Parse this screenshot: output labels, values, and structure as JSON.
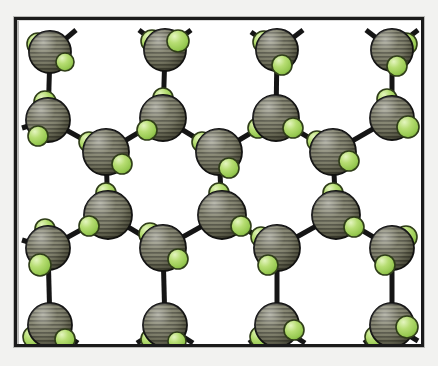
{
  "figure": {
    "kind": "molecular-lattice-diagram",
    "title": "",
    "caption": "",
    "frame": {
      "border_color": "#1b1b1b",
      "border_width": 3,
      "background": "#ffffff",
      "paper_color": "#f2f2f0",
      "x": 14,
      "y": 17,
      "width": 410,
      "height": 330
    },
    "legend": [],
    "annotations": []
  },
  "chart_data": {
    "type": "scatter",
    "title": "",
    "xlabel": "",
    "ylabel": "",
    "grid": false,
    "legend_position": "none",
    "xlim": [
      0,
      438
    ],
    "ylim": [
      0,
      366
    ],
    "species": [
      {
        "name": "large-hatched-sphere",
        "role": "central atom",
        "color": "#74745f",
        "highlight": "#9a9a86",
        "shadow": "#4c4c3e",
        "outline": "#141414",
        "hatch": "horizontal-lines",
        "radius": 20
      },
      {
        "name": "small-green-sphere",
        "role": "ligand atom",
        "color": "#a9d466",
        "highlight": "#c9e792",
        "shadow": "#7fa93f",
        "outline": "#2c3a16",
        "hatch": "none",
        "radius": 10
      }
    ],
    "bond": {
      "color": "#151515",
      "width": 5
    },
    "atoms": [
      {
        "id": "a1",
        "x": 50,
        "y": 52,
        "r": 21,
        "ligands": [
          {
            "dx": -12,
            "dy": -8,
            "r": 11
          },
          {
            "dx": 15,
            "dy": 10,
            "r": 9
          }
        ],
        "stubs": [
          {
            "dx": 26,
            "dy": -22
          },
          {
            "dx": -22,
            "dy": -12
          }
        ]
      },
      {
        "id": "a2",
        "x": 165,
        "y": 50,
        "r": 21,
        "ligands": [
          {
            "dx": -13,
            "dy": -9,
            "r": 11
          },
          {
            "dx": 13,
            "dy": -9,
            "r": 11
          }
        ],
        "stubs": [
          {
            "dx": 26,
            "dy": -20
          },
          {
            "dx": -26,
            "dy": -20
          }
        ]
      },
      {
        "id": "a3",
        "x": 277,
        "y": 50,
        "r": 21,
        "ligands": [
          {
            "dx": -13,
            "dy": -8,
            "r": 11
          },
          {
            "dx": 5,
            "dy": 15,
            "r": 10
          }
        ],
        "stubs": [
          {
            "dx": 26,
            "dy": -20
          },
          {
            "dx": -26,
            "dy": -18
          }
        ]
      },
      {
        "id": "a4",
        "x": 392,
        "y": 50,
        "r": 21,
        "ligands": [
          {
            "dx": 14,
            "dy": -6,
            "r": 11
          },
          {
            "dx": 5,
            "dy": 16,
            "r": 10
          }
        ],
        "stubs": [
          {
            "dx": 26,
            "dy": -20
          },
          {
            "dx": -26,
            "dy": -20
          }
        ]
      },
      {
        "id": "b1",
        "x": 48,
        "y": 120,
        "r": 22,
        "ligands": [
          {
            "dx": -3,
            "dy": -18,
            "r": 11
          },
          {
            "dx": -10,
            "dy": 16,
            "r": 10
          }
        ],
        "stubs": [
          {
            "dx": -26,
            "dy": 8
          }
        ]
      },
      {
        "id": "b2",
        "x": 163,
        "y": 118,
        "r": 23,
        "ligands": [
          {
            "dx": 0,
            "dy": -20,
            "r": 10
          },
          {
            "dx": -16,
            "dy": 12,
            "r": 10
          }
        ],
        "stubs": []
      },
      {
        "id": "b3",
        "x": 276,
        "y": 118,
        "r": 23,
        "ligands": [
          {
            "dx": -18,
            "dy": 10,
            "r": 10
          },
          {
            "dx": 17,
            "dy": 10,
            "r": 10
          }
        ],
        "stubs": []
      },
      {
        "id": "b4",
        "x": 392,
        "y": 118,
        "r": 22,
        "ligands": [
          {
            "dx": -5,
            "dy": -19,
            "r": 10
          },
          {
            "dx": 16,
            "dy": 9,
            "r": 11
          }
        ],
        "stubs": []
      },
      {
        "id": "c1",
        "x": 106,
        "y": 152,
        "r": 23,
        "ligands": [
          {
            "dx": -17,
            "dy": -10,
            "r": 10
          },
          {
            "dx": 16,
            "dy": 12,
            "r": 10
          }
        ],
        "stubs": []
      },
      {
        "id": "c2",
        "x": 219,
        "y": 152,
        "r": 23,
        "ligands": [
          {
            "dx": -17,
            "dy": -10,
            "r": 10
          },
          {
            "dx": 10,
            "dy": 16,
            "r": 10
          }
        ],
        "stubs": []
      },
      {
        "id": "c3",
        "x": 333,
        "y": 152,
        "r": 23,
        "ligands": [
          {
            "dx": -16,
            "dy": -11,
            "r": 10
          },
          {
            "dx": 16,
            "dy": 9,
            "r": 10
          }
        ],
        "stubs": []
      },
      {
        "id": "d1",
        "x": 108,
        "y": 215,
        "r": 24,
        "ligands": [
          {
            "dx": -2,
            "dy": -22,
            "r": 10
          },
          {
            "dx": -19,
            "dy": 11,
            "r": 10
          }
        ],
        "stubs": []
      },
      {
        "id": "d2",
        "x": 222,
        "y": 215,
        "r": 24,
        "ligands": [
          {
            "dx": -3,
            "dy": -22,
            "r": 10
          },
          {
            "dx": 19,
            "dy": 11,
            "r": 10
          }
        ],
        "stubs": []
      },
      {
        "id": "d3",
        "x": 336,
        "y": 215,
        "r": 24,
        "ligands": [
          {
            "dx": -3,
            "dy": -22,
            "r": 10
          },
          {
            "dx": 18,
            "dy": 12,
            "r": 10
          }
        ],
        "stubs": []
      },
      {
        "id": "e1",
        "x": 48,
        "y": 248,
        "r": 22,
        "ligands": [
          {
            "dx": -3,
            "dy": -19,
            "r": 10
          },
          {
            "dx": -8,
            "dy": 17,
            "r": 11
          }
        ],
        "stubs": [
          {
            "dx": -26,
            "dy": -8
          }
        ]
      },
      {
        "id": "e2",
        "x": 163,
        "y": 248,
        "r": 23,
        "ligands": [
          {
            "dx": -13,
            "dy": -14,
            "r": 11
          },
          {
            "dx": 15,
            "dy": 11,
            "r": 10
          }
        ],
        "stubs": []
      },
      {
        "id": "e3",
        "x": 277,
        "y": 248,
        "r": 23,
        "ligands": [
          {
            "dx": -16,
            "dy": -11,
            "r": 10
          },
          {
            "dx": -9,
            "dy": 17,
            "r": 10
          }
        ],
        "stubs": []
      },
      {
        "id": "e4",
        "x": 392,
        "y": 248,
        "r": 22,
        "ligands": [
          {
            "dx": 14,
            "dy": -11,
            "r": 11
          },
          {
            "dx": -7,
            "dy": 17,
            "r": 10
          }
        ],
        "stubs": []
      },
      {
        "id": "f1",
        "x": 50,
        "y": 325,
        "r": 22,
        "ligands": [
          {
            "dx": -16,
            "dy": 12,
            "r": 11
          },
          {
            "dx": 15,
            "dy": 14,
            "r": 10
          }
        ],
        "stubs": [
          {
            "dx": 28,
            "dy": 18
          }
        ]
      },
      {
        "id": "f2",
        "x": 165,
        "y": 325,
        "r": 22,
        "ligands": [
          {
            "dx": -14,
            "dy": 14,
            "r": 10
          },
          {
            "dx": 12,
            "dy": 16,
            "r": 9
          }
        ],
        "stubs": [
          {
            "dx": 28,
            "dy": 18
          },
          {
            "dx": -28,
            "dy": 18
          }
        ]
      },
      {
        "id": "f3",
        "x": 277,
        "y": 325,
        "r": 22,
        "ligands": [
          {
            "dx": -16,
            "dy": 12,
            "r": 11
          },
          {
            "dx": 17,
            "dy": 5,
            "r": 10
          }
        ],
        "stubs": [
          {
            "dx": 28,
            "dy": 18
          },
          {
            "dx": -28,
            "dy": 18
          }
        ]
      },
      {
        "id": "f4",
        "x": 392,
        "y": 325,
        "r": 22,
        "ligands": [
          {
            "dx": -16,
            "dy": 12,
            "r": 11
          },
          {
            "dx": 15,
            "dy": 2,
            "r": 11
          }
        ],
        "stubs": [
          {
            "dx": 26,
            "dy": 16
          },
          {
            "dx": -28,
            "dy": 18
          }
        ]
      }
    ],
    "bonds": [
      {
        "from": "a1",
        "to": "b1"
      },
      {
        "from": "a2",
        "to": "b2"
      },
      {
        "from": "a3",
        "to": "b3"
      },
      {
        "from": "a4",
        "to": "b4"
      },
      {
        "from": "b1",
        "to": "c1"
      },
      {
        "from": "c1",
        "to": "b2"
      },
      {
        "from": "b2",
        "to": "c2"
      },
      {
        "from": "c2",
        "to": "b3"
      },
      {
        "from": "b3",
        "to": "c3"
      },
      {
        "from": "c3",
        "to": "b4"
      },
      {
        "from": "c1",
        "to": "d1"
      },
      {
        "from": "c2",
        "to": "d2"
      },
      {
        "from": "c3",
        "to": "d3"
      },
      {
        "from": "e1",
        "to": "d1"
      },
      {
        "from": "d1",
        "to": "e2"
      },
      {
        "from": "e2",
        "to": "d2"
      },
      {
        "from": "d2",
        "to": "e3"
      },
      {
        "from": "e3",
        "to": "d3"
      },
      {
        "from": "d3",
        "to": "e4"
      },
      {
        "from": "e1",
        "to": "f1"
      },
      {
        "from": "e2",
        "to": "f2"
      },
      {
        "from": "e3",
        "to": "f3"
      },
      {
        "from": "e4",
        "to": "f4"
      }
    ]
  }
}
